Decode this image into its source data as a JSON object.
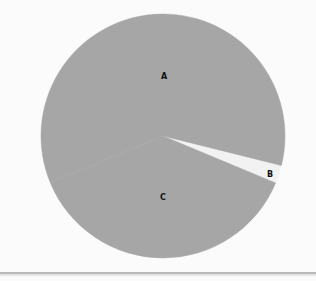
{
  "chart_data": {
    "type": "pie",
    "title": "",
    "categories": [
      "A",
      "B",
      "C"
    ],
    "values": [
      60.1,
      2.4,
      37.5
    ],
    "units": "percent (estimated from slice angles)",
    "start_angle_deg": 22.7,
    "direction": "counterclockwise from B lower edge",
    "legend": "none (labels inside slices)",
    "slices": [
      {
        "label": "A",
        "value": 60.1,
        "color": "#a6a6a6"
      },
      {
        "label": "B",
        "value": 2.4,
        "color": "#f2f2f2"
      },
      {
        "label": "C",
        "value": 37.5,
        "color": "#a6a6a6"
      }
    ]
  },
  "colors": {
    "background": "#fbfbfb",
    "slice_default": "#a6a6a6",
    "slice_highlight": "#f2f2f2",
    "label": "#111111",
    "rule": "#b9b9b9"
  },
  "labels": {
    "a": "A",
    "b": "B",
    "c": "C"
  }
}
